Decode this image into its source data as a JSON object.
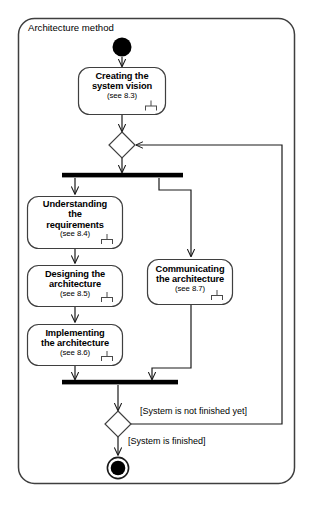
{
  "diagram": {
    "type": "uml-activity-diagram",
    "frame_title": "Architecture method",
    "frame": {
      "x": 18,
      "y": 18,
      "width": 277,
      "height": 466
    },
    "nodes": [
      {
        "id": "start",
        "kind": "initial-node",
        "name": "start-node",
        "cx": 122,
        "cy": 47,
        "r": 9.5
      },
      {
        "id": "creating",
        "kind": "activity",
        "name": "activity-creating-the-system-vision",
        "title": "Creating the\nsystem vision",
        "reference": "(see 8.3)",
        "has_subactivity_icon": true,
        "x": 78,
        "y": 67,
        "width": 88,
        "height": 48
      },
      {
        "id": "merge-top",
        "kind": "merge-node",
        "name": "merge-diamond-top",
        "cx": 122,
        "cy": 145,
        "rx": 13,
        "ry": 13
      },
      {
        "id": "fork",
        "kind": "fork-bar",
        "name": "fork-bar",
        "x1": 62,
        "x2": 183,
        "y": 175,
        "thickness": 5
      },
      {
        "id": "understanding",
        "kind": "activity",
        "name": "activity-understanding-the-requirements",
        "title": "Understanding\nthe\nrequirements",
        "reference": "(see 8.4)",
        "has_subactivity_icon": true,
        "x": 27,
        "y": 196,
        "width": 96,
        "height": 53
      },
      {
        "id": "designing",
        "kind": "activity",
        "name": "activity-designing-the-architecture",
        "title": "Designing the\narchitecture",
        "reference": "(see 8.5)",
        "has_subactivity_icon": true,
        "x": 27,
        "y": 265,
        "width": 96,
        "height": 42
      },
      {
        "id": "implementing",
        "kind": "activity",
        "name": "activity-implementing-the-architecture",
        "title": "Implementing\nthe architecture",
        "reference": "(see 8.6)",
        "has_subactivity_icon": true,
        "x": 27,
        "y": 324,
        "width": 96,
        "height": 42
      },
      {
        "id": "communicating",
        "kind": "activity",
        "name": "activity-communicating-the-architecture",
        "title": "Communicating\nthe architecture",
        "reference": "(see 8.7)",
        "has_subactivity_icon": true,
        "x": 147,
        "y": 259,
        "width": 86,
        "height": 46
      },
      {
        "id": "join",
        "kind": "join-bar",
        "name": "join-bar",
        "x1": 62,
        "x2": 178,
        "y": 382,
        "thickness": 5
      },
      {
        "id": "decision",
        "kind": "decision-node",
        "name": "decision-diamond-bottom",
        "cx": 118,
        "cy": 424,
        "rx": 13,
        "ry": 13
      },
      {
        "id": "final",
        "kind": "final-node",
        "name": "final-node",
        "cx": 118,
        "cy": 468,
        "r_outer": 11,
        "r_inner": 7.5
      }
    ],
    "guards": [
      {
        "id": "guard-not-finished",
        "name": "guard-label-system-not-finished",
        "text": "[System is not finished yet]",
        "x": 140,
        "y": 406
      },
      {
        "id": "guard-finished",
        "name": "guard-label-system-finished",
        "text": "[System is finished]",
        "x": 128,
        "y": 436
      }
    ],
    "colors": {
      "stroke": "#1a1a1a",
      "bar_fill": "#000000",
      "node_fill": "#000000",
      "background": "#ffffff",
      "frame_stroke": "#3a3a3a",
      "text": "#000000"
    }
  }
}
